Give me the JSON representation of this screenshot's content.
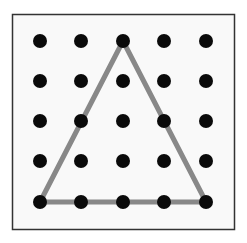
{
  "diagram": {
    "type": "geoboard",
    "grid": {
      "rows": 5,
      "cols": 5
    },
    "frame": {
      "x": 12,
      "y": 14,
      "width": 222,
      "height": 215,
      "fill": "#f9f9f9",
      "stroke": "#333333"
    },
    "x_centers": [
      40,
      81,
      123,
      164,
      206
    ],
    "y_centers": [
      41,
      81,
      121,
      161,
      202
    ],
    "dot": {
      "radius": 7,
      "color": "#0a0a0a"
    },
    "shape": {
      "name": "triangle",
      "vertices_grid": [
        [
          2,
          0
        ],
        [
          0,
          4
        ],
        [
          4,
          4
        ]
      ],
      "stroke": "#888888",
      "stroke_width": 5
    }
  }
}
